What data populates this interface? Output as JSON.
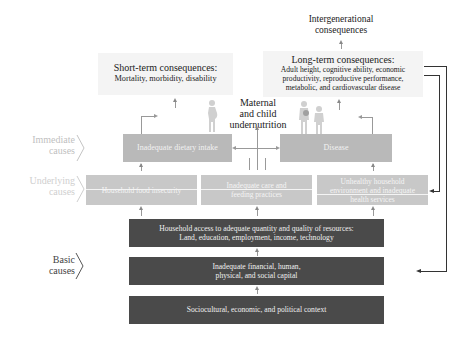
{
  "top": {
    "intergenerational": [
      "Intergenerational",
      "consequences"
    ],
    "short_term": {
      "title": "Short-term consequences:",
      "body": "Mortality, morbidity, disability"
    },
    "long_term": {
      "title": "Long-term consequences:",
      "lines": [
        "Adult height, cognitive ability, economic",
        "productivity, reproductive performance,",
        "metabolic, and cardiovascular disease"
      ]
    },
    "center_label": [
      "Maternal",
      "and child",
      "undernutrition"
    ]
  },
  "levels": {
    "immediate": [
      "Immediate",
      "causes"
    ],
    "underlying": [
      "Underlying",
      "causes"
    ],
    "basic": [
      "Basic",
      "causes"
    ]
  },
  "immediate_boxes": [
    "Inadequate dietary intake",
    "Disease"
  ],
  "underlying_boxes": [
    [
      "Household food insecurity"
    ],
    [
      "Inadequate care and",
      "feeding practices"
    ],
    [
      "Unhealthy household",
      "environment and inadequate",
      "health services"
    ]
  ],
  "basic_boxes": [
    [
      "Household access to adequate quantity and quality of resources:",
      "Land, education, employment, income, technology"
    ],
    [
      "Inadequate financial, human,",
      "physical, and social capital"
    ],
    [
      "Sociocultural, economic, and political context"
    ]
  ],
  "icons": [
    "pregnant-woman-icon",
    "mother-child-icon"
  ],
  "colors": {
    "immediate_fill": "#b9b9b9",
    "underlying_fill": "#c8c8c8",
    "basic_fill": "#4a4a4a",
    "consequence_fill": "#f4f4f4"
  }
}
